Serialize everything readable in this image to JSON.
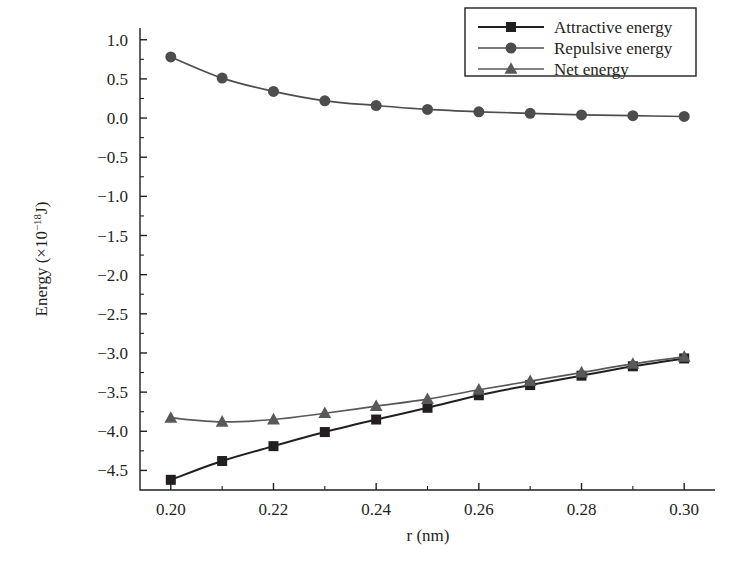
{
  "chart_data": {
    "type": "line",
    "title": "",
    "xlabel": "r (nm)",
    "ylabel": "Energy (×10⁻¹⁸J)",
    "ylabel_parts": {
      "prefix": "Energy (×10",
      "exponent": "−18",
      "suffix": "J)"
    },
    "x": [
      0.2,
      0.21,
      0.22,
      0.23,
      0.24,
      0.25,
      0.26,
      0.27,
      0.28,
      0.29,
      0.3
    ],
    "xlim": [
      0.194,
      0.306
    ],
    "ylim": [
      -4.75,
      1.15
    ],
    "xticks": [
      0.2,
      0.22,
      0.24,
      0.26,
      0.28,
      0.3
    ],
    "xtick_labels": [
      "0.20",
      "0.22",
      "0.24",
      "0.26",
      "0.28",
      "0.30"
    ],
    "xticks_minor": [
      0.21,
      0.23,
      0.25,
      0.27,
      0.29
    ],
    "yticks": [
      1.0,
      0.5,
      0.0,
      -0.5,
      -1.0,
      -1.5,
      -2.0,
      -2.5,
      -3.0,
      -3.5,
      -4.0,
      -4.5
    ],
    "ytick_labels": [
      "1.0",
      "0.5",
      "0.0",
      "−0.5",
      "−1.0",
      "−1.5",
      "−2.0",
      "−2.5",
      "−3.0",
      "−3.5",
      "−4.0",
      "−4.5"
    ],
    "yticks_minor": [
      0.75,
      0.25,
      -0.25,
      -0.75,
      -1.25,
      -1.75,
      -2.25,
      -2.75,
      -3.25,
      -3.75,
      -4.25
    ],
    "grid": false,
    "legend_position": "top-right",
    "series": [
      {
        "name": "Attractive energy",
        "marker": "square",
        "color": "#231f20",
        "values": [
          -4.62,
          -4.38,
          -4.19,
          -4.01,
          -3.85,
          -3.7,
          -3.54,
          -3.41,
          -3.29,
          -3.17,
          -3.07
        ]
      },
      {
        "name": "Repulsive energy",
        "marker": "circle",
        "color": "#4d4d4d",
        "values": [
          0.78,
          0.51,
          0.34,
          0.22,
          0.16,
          0.11,
          0.08,
          0.06,
          0.04,
          0.03,
          0.02
        ]
      },
      {
        "name": "Net energy",
        "marker": "triangle",
        "color": "#595959",
        "values": [
          -3.83,
          -3.88,
          -3.85,
          -3.77,
          -3.68,
          -3.59,
          -3.47,
          -3.36,
          -3.25,
          -3.14,
          -3.05
        ]
      }
    ]
  },
  "legend": {
    "entries": [
      {
        "label": "Attractive energy"
      },
      {
        "label": "Repulsive energy"
      },
      {
        "label": "Net energy"
      }
    ]
  }
}
